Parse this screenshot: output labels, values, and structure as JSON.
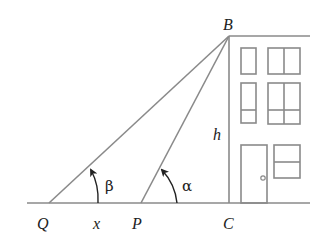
{
  "diagram": {
    "points": {
      "B": {
        "label": "B",
        "x": 229,
        "y": 36
      },
      "C": {
        "label": "C",
        "x": 229,
        "y": 203
      },
      "P": {
        "label": "P",
        "x": 141,
        "y": 203
      },
      "Q": {
        "label": "Q",
        "x": 49,
        "y": 203
      }
    },
    "labels": {
      "B": "B",
      "C": "C",
      "P": "P",
      "Q": "Q",
      "h": "h",
      "x": "x",
      "alpha": "α",
      "beta": "β"
    },
    "segments": [
      {
        "name": "QB",
        "from": "Q",
        "to": "B"
      },
      {
        "name": "PB",
        "from": "P",
        "to": "B"
      },
      {
        "name": "BC",
        "from": "B",
        "to": "C",
        "label": "h"
      },
      {
        "name": "QP",
        "from": "Q",
        "to": "P",
        "label": "x"
      }
    ],
    "angles": [
      {
        "name": "beta",
        "vertex": "Q",
        "label": "β"
      },
      {
        "name": "alpha",
        "vertex": "P",
        "label": "α"
      }
    ],
    "building": {
      "windows": 5,
      "door": 1
    },
    "colors": {
      "line": "#8a8a8a",
      "text": "#222222",
      "background": "#ffffff"
    }
  }
}
